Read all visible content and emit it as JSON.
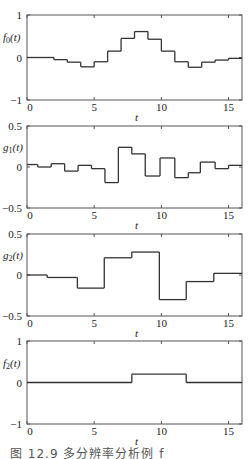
{
  "chart_data": [
    {
      "type": "line",
      "style": "step",
      "ylabel": "f0(t)",
      "ylabel_main": "f",
      "ylabel_sub": "0",
      "ylabel_arg": "(t)",
      "xlabel": "t",
      "xlim": [
        0,
        16
      ],
      "ylim": [
        -1,
        1
      ],
      "xticks": [
        0,
        5,
        10,
        15
      ],
      "yticks": [
        -1,
        0,
        1
      ],
      "ytick_labels": [
        "−1",
        "0",
        "1"
      ],
      "breaks": [
        0,
        2,
        3,
        4,
        5,
        6,
        7,
        8,
        9,
        10,
        11,
        12,
        13,
        14,
        15,
        16
      ],
      "values": [
        0,
        -0.05,
        -0.11,
        -0.22,
        -0.1,
        0.15,
        0.45,
        0.61,
        0.43,
        0.15,
        -0.1,
        -0.23,
        -0.11,
        -0.06,
        -0.02
      ]
    },
    {
      "type": "line",
      "style": "step",
      "ylabel": "g1(t)",
      "ylabel_main": "g",
      "ylabel_sub": "1",
      "ylabel_arg": "(t)",
      "xlabel": "t",
      "xlim": [
        0,
        16
      ],
      "ylim": [
        -0.5,
        0.5
      ],
      "xticks": [
        0,
        5,
        10,
        15
      ],
      "yticks": [
        -0.5,
        0,
        0.5
      ],
      "ytick_labels": [
        "−0.5",
        "0",
        "0.5"
      ],
      "breaks": [
        0,
        0.8,
        1.8,
        2.8,
        3.8,
        4.8,
        5.8,
        6.8,
        7.8,
        8.8,
        9.9,
        11,
        12,
        12.9,
        14,
        15,
        16
      ],
      "values": [
        0.03,
        0.0,
        0.04,
        -0.05,
        0.02,
        -0.02,
        -0.19,
        0.24,
        0.16,
        -0.11,
        0.11,
        -0.13,
        -0.07,
        0.06,
        -0.02,
        0.02
      ]
    },
    {
      "type": "line",
      "style": "step",
      "ylabel": "g2(t)",
      "ylabel_main": "g",
      "ylabel_sub": "2",
      "ylabel_arg": "(t)",
      "xlabel": "t",
      "xlim": [
        0,
        16
      ],
      "ylim": [
        -0.5,
        0.5
      ],
      "xticks": [
        0,
        5,
        10,
        15
      ],
      "yticks": [
        -0.5,
        0,
        0.5
      ],
      "ytick_labels": [
        "−0.5",
        "0",
        "0.5"
      ],
      "breaks": [
        0,
        1.5,
        3.75,
        5.75,
        7.8,
        9.85,
        11.85,
        13.9,
        16
      ],
      "values": [
        0.0,
        -0.03,
        -0.16,
        0.21,
        0.28,
        -0.3,
        -0.08,
        0.02
      ]
    },
    {
      "type": "line",
      "style": "step",
      "ylabel": "f2(t)",
      "ylabel_main": "f",
      "ylabel_sub": "2",
      "ylabel_arg": "(t)",
      "xlabel": "t",
      "xlim": [
        0,
        16
      ],
      "ylim": [
        -1,
        1
      ],
      "xticks": [
        0,
        5,
        10,
        15
      ],
      "yticks": [
        -1,
        0,
        1
      ],
      "ytick_labels": [
        "−1",
        "0",
        "1"
      ],
      "breaks": [
        0,
        7.8,
        11.85,
        16
      ],
      "values": [
        0,
        0.2,
        0
      ]
    }
  ],
  "caption": "图 12.9   多分辨率分析例 f"
}
